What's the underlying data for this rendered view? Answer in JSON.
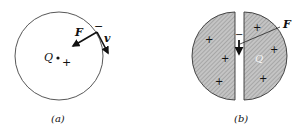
{
  "figure": {
    "panel_a": {
      "caption": "(a)",
      "charge_label": "Q",
      "center_sign": "+",
      "electron_sign": "−",
      "force_label": "F",
      "velocity_label": "v"
    },
    "panel_b": {
      "caption": "(b)",
      "charge_label": "Q",
      "electron_sign": "−",
      "force_label": "F",
      "plus_signs": [
        "+",
        "+",
        "+",
        "+",
        "+",
        "+"
      ]
    }
  }
}
